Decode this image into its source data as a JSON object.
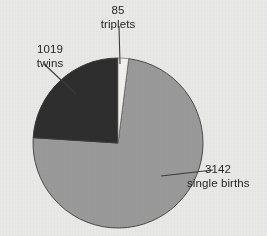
{
  "figure": {
    "background_color": "#e9e9e7",
    "text_color": "#26262a",
    "outline_color": "#4a4a4a",
    "leader_color": "#3c3c3c"
  },
  "chart_data": {
    "type": "pie",
    "title": "",
    "subtitle": "",
    "xlabel": "",
    "ylabel": "",
    "grid": false,
    "legend_position": "none",
    "label_format": "value above category",
    "total": 4246,
    "start_angle_deg": 0,
    "direction": "clockwise",
    "categories": [
      "single births",
      "twins",
      "triplets"
    ],
    "values": [
      3142,
      1019,
      85
    ],
    "colors": [
      "#9a9a9a",
      "#2e2e2e",
      "#f2f1ee"
    ],
    "slices": [
      {
        "category": "single births",
        "value": 3142,
        "value_text": "3142",
        "category_text": "single births",
        "color": "#9a9a9a",
        "percent": 74.0,
        "angle_deg": 266.4,
        "start_deg": 7.2,
        "end_deg": 273.6,
        "label_position": "right"
      },
      {
        "category": "twins",
        "value": 1019,
        "value_text": "1019",
        "category_text": "twins",
        "color": "#2e2e2e",
        "percent": 24.0,
        "angle_deg": 86.4,
        "start_deg": 273.6,
        "end_deg": 360.0,
        "label_position": "upper-left"
      },
      {
        "category": "triplets",
        "value": 85,
        "value_text": "85",
        "category_text": "triplets",
        "color": "#f2f1ee",
        "percent": 2.0,
        "angle_deg": 7.2,
        "start_deg": 0.0,
        "end_deg": 7.2,
        "label_position": "top"
      }
    ]
  },
  "geometry": {
    "center_x": 118,
    "center_y": 143,
    "radius": 85
  }
}
